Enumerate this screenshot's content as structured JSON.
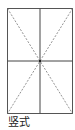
{
  "diagram": {
    "type": "rice-grid",
    "orientation_label": "竖式",
    "frame": {
      "x": 7,
      "y": 8,
      "width": 66,
      "height": 106
    },
    "colors": {
      "frame": "#555555",
      "center_lines": "#444444",
      "diagonals": "#777777",
      "label": "#222222"
    }
  }
}
